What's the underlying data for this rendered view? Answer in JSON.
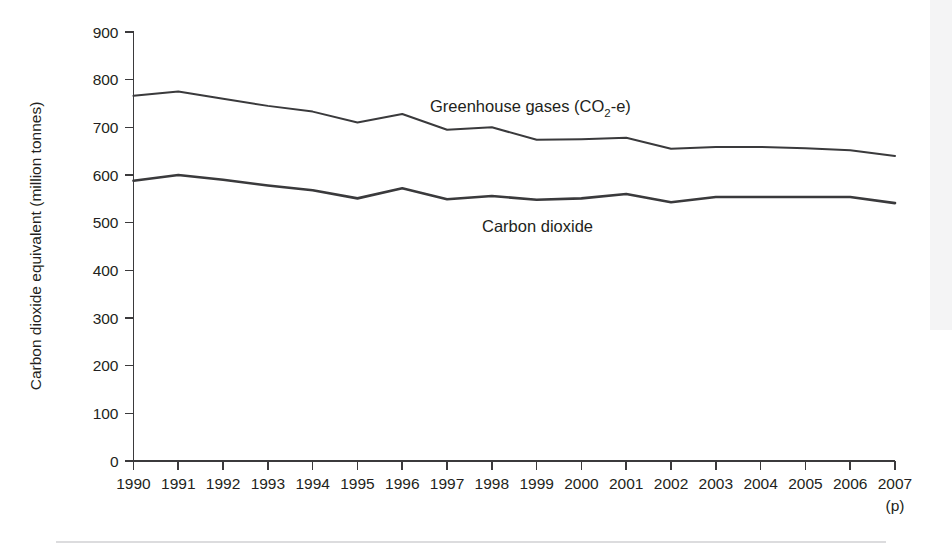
{
  "chart_data": {
    "type": "line",
    "title": "",
    "xlabel": "",
    "ylabel": "Carbon dioxide equivalent (million tonnes)",
    "x": [
      1990,
      1991,
      1992,
      1993,
      1994,
      1995,
      1996,
      1997,
      1998,
      1999,
      2000,
      2001,
      2002,
      2003,
      2004,
      2005,
      2006,
      2007
    ],
    "x_tick_labels": [
      "1990",
      "1991",
      "1992",
      "1993",
      "1994",
      "1995",
      "1996",
      "1997",
      "1998",
      "1999",
      "2000",
      "2001",
      "2002",
      "2003",
      "2004",
      "2005",
      "2006",
      "2007"
    ],
    "x_last_note": "(p)",
    "y_tick_labels": [
      "900",
      "800",
      "700",
      "600",
      "500",
      "400",
      "300",
      "200",
      "100",
      "0"
    ],
    "y_ticks": [
      0,
      100,
      200,
      300,
      400,
      500,
      600,
      700,
      800,
      900
    ],
    "ylim": [
      0,
      900
    ],
    "grid": false,
    "legend_position": "inline-annotation",
    "series": [
      {
        "name": "Greenhouse gases (CO2-e)",
        "label_main": "Greenhouse gases (CO",
        "label_sub": "2",
        "label_tail": "-e)",
        "color": "#3a3a3c",
        "values": [
          766,
          775,
          760,
          745,
          733,
          710,
          728,
          695,
          700,
          674,
          675,
          678,
          655,
          659,
          659,
          656,
          652,
          640
        ]
      },
      {
        "name": "Carbon dioxide",
        "label_main": "Carbon dioxide",
        "color": "#3a3a3c",
        "values": [
          588,
          600,
          590,
          578,
          568,
          551,
          572,
          549,
          556,
          548,
          551,
          560,
          543,
          554,
          554,
          554,
          554,
          541
        ]
      }
    ]
  },
  "axis": {
    "y_title": "Carbon dioxide equivalent (million tonnes)"
  },
  "annotations": {
    "ghg_label_x": 430,
    "ghg_label_y": 112,
    "co2_label_x": 482,
    "co2_label_y": 232
  }
}
